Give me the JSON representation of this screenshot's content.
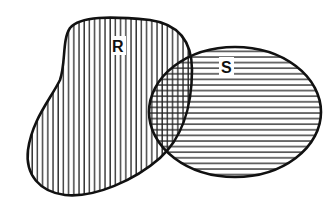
{
  "diagram": {
    "type": "venn",
    "sets": [
      {
        "id": "R",
        "label": "R",
        "hatch": "vertical"
      },
      {
        "id": "S",
        "label": "S",
        "hatch": "horizontal"
      }
    ],
    "intersection": {
      "sets": [
        "R",
        "S"
      ],
      "hatch": "cross"
    },
    "colors": {
      "stroke": "#111111",
      "hatch": "#222222",
      "background": "#ffffff"
    }
  }
}
